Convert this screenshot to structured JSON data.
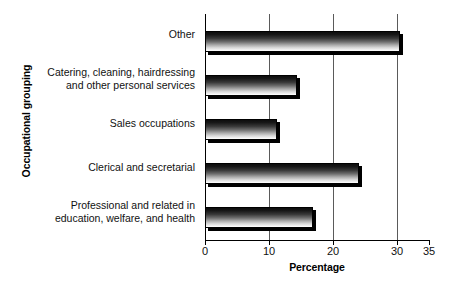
{
  "chart_data": {
    "type": "bar",
    "orientation": "horizontal",
    "title": "",
    "xlabel": "Percentage",
    "ylabel": "Occupational grouping",
    "xlim": [
      0,
      35
    ],
    "xticks": [
      0,
      10,
      20,
      30,
      35
    ],
    "xticklabels": [
      "0",
      "10",
      "20",
      "30",
      "35"
    ],
    "grid": "vertical",
    "legend": "none",
    "categories": [
      "Other",
      "Catering, cleaning, hairdressing\nand other personal services",
      "Sales occupations",
      "Clerical and secretarial",
      "Professional and related in\neducation, welfare, and health"
    ],
    "values": [
      30.5,
      14.3,
      11.3,
      24.0,
      16.8
    ],
    "bars": [
      {
        "label": "Other",
        "value": 30.5
      },
      {
        "label": "Catering, cleaning, hairdressing\nand other personal services",
        "value": 14.3
      },
      {
        "label": "Sales occupations",
        "value": 11.3
      },
      {
        "label": "Clerical and secretarial",
        "value": 24.0
      },
      {
        "label": "Professional and related in\neducation, welfare, and health",
        "value": 16.8
      }
    ],
    "colors": {
      "bar_gradient_top": "#0d0d0d",
      "bar_gradient_bottom": "#ffffff",
      "bar_border": "#000000",
      "bar_shadow": "#000000",
      "gridline": "#5a5a5a",
      "axis": "#000000",
      "text": "#111111",
      "background": "#ffffff"
    }
  }
}
